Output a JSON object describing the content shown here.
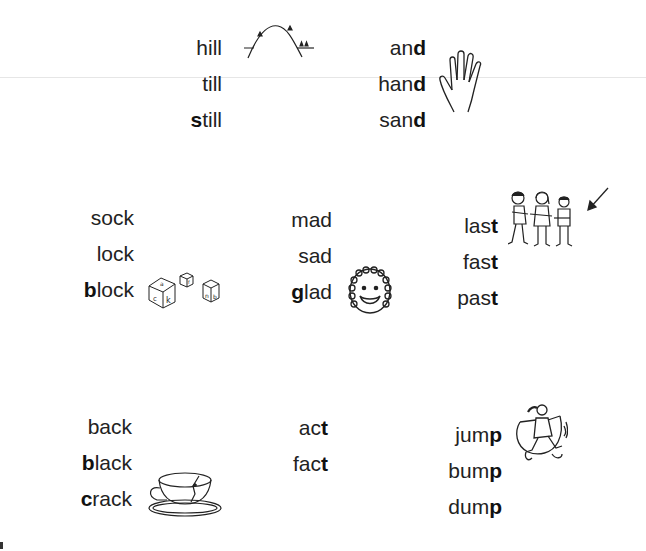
{
  "page": {
    "groups": [
      {
        "id": "ill",
        "words": [
          {
            "pre": "h",
            "bold": "",
            "rest": "ill",
            "full": "hill"
          },
          {
            "pre": "",
            "bold": "",
            "rest": "till",
            "full": "till"
          },
          {
            "pre": "",
            "bold": "s",
            "rest": "till",
            "full": "still"
          }
        ],
        "picture": "hill-icon"
      },
      {
        "id": "and",
        "words": [
          {
            "pre": "an",
            "bold": "d",
            "rest": "",
            "full": "and"
          },
          {
            "pre": "han",
            "bold": "d",
            "rest": "",
            "full": "hand"
          },
          {
            "pre": "san",
            "bold": "d",
            "rest": "",
            "full": "sand"
          }
        ],
        "picture": "hand-icon"
      },
      {
        "id": "ock",
        "words": [
          {
            "pre": "sock",
            "bold": "",
            "rest": "",
            "full": "sock"
          },
          {
            "pre": "lock",
            "bold": "",
            "rest": "",
            "full": "lock"
          },
          {
            "pre": "",
            "bold": "b",
            "rest": "lock",
            "full": "block"
          }
        ],
        "picture": "blocks-icon"
      },
      {
        "id": "ad",
        "words": [
          {
            "pre": "mad",
            "bold": "",
            "rest": "",
            "full": "mad"
          },
          {
            "pre": "sad",
            "bold": "",
            "rest": "",
            "full": "sad"
          },
          {
            "pre": "",
            "bold": "g",
            "rest": "lad",
            "full": "glad"
          }
        ],
        "picture": "smiling-face-icon"
      },
      {
        "id": "ast",
        "words": [
          {
            "pre": "las",
            "bold": "t",
            "rest": "",
            "full": "last"
          },
          {
            "pre": "fas",
            "bold": "t",
            "rest": "",
            "full": "fast"
          },
          {
            "pre": "pas",
            "bold": "t",
            "rest": "",
            "full": "past"
          }
        ],
        "picture": "children-line-icon"
      },
      {
        "id": "ack",
        "words": [
          {
            "pre": "back",
            "bold": "",
            "rest": "",
            "full": "back"
          },
          {
            "pre": "",
            "bold": "b",
            "rest": "lack",
            "full": "black"
          },
          {
            "pre": "",
            "bold": "c",
            "rest": "rack",
            "full": "crack"
          }
        ],
        "picture": "cracked-cup-icon"
      },
      {
        "id": "act",
        "words": [
          {
            "pre": "ac",
            "bold": "t",
            "rest": "",
            "full": "act"
          },
          {
            "pre": "fac",
            "bold": "t",
            "rest": "",
            "full": "fact"
          }
        ],
        "picture": ""
      },
      {
        "id": "ump",
        "words": [
          {
            "pre": "jum",
            "bold": "p",
            "rest": "",
            "full": "jump"
          },
          {
            "pre": "bum",
            "bold": "p",
            "rest": "",
            "full": "bump"
          },
          {
            "pre": "dum",
            "bold": "p",
            "rest": "",
            "full": "dump"
          }
        ],
        "picture": "jump-rope-girl-icon"
      }
    ]
  }
}
